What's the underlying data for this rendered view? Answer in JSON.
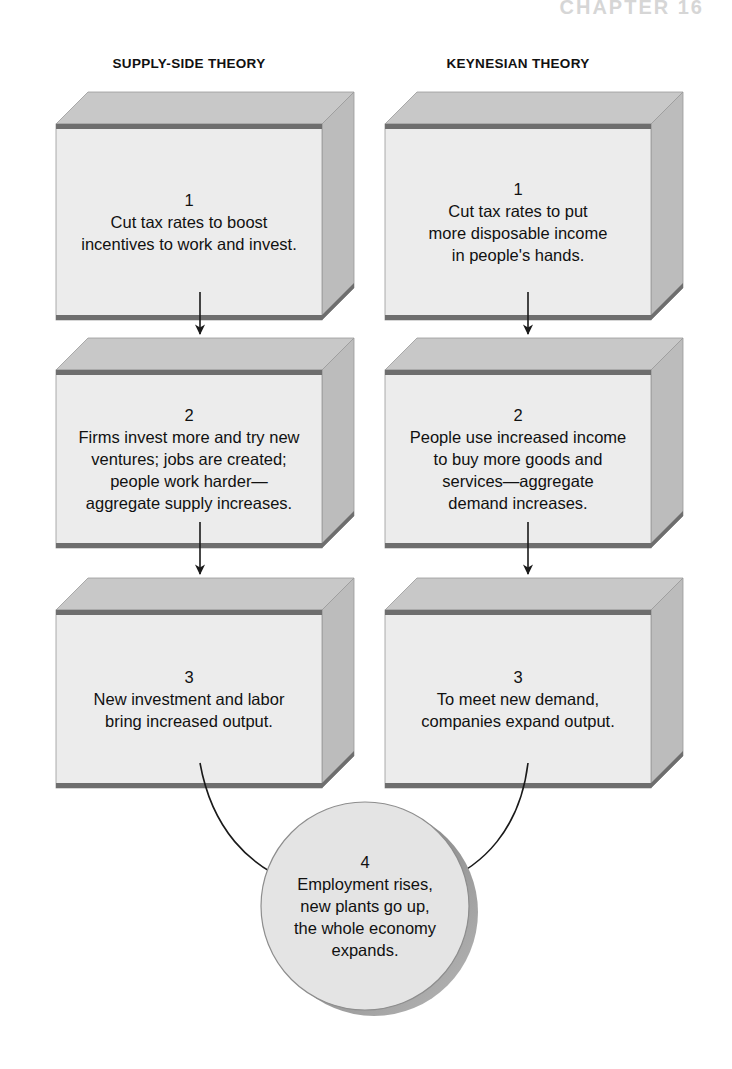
{
  "page": {
    "running_head": "CHAPTER 16",
    "background": "#ffffff",
    "width": 732,
    "height": 1069
  },
  "columns": [
    {
      "id": "supply-side",
      "title": "SUPPLY-SIDE THEORY"
    },
    {
      "id": "keynesian",
      "title": "KEYNESIAN THEORY"
    }
  ],
  "style": {
    "box_front": "#ececec",
    "box_top": "#c8c8c8",
    "box_side": "#bcbcbc",
    "bevel_line": "#6e6e6e",
    "outline": "#9a9a9a",
    "disk_face": "#e4e4e4",
    "disk_rim": "#a5a5a5",
    "arrow": "#1a1a1a"
  },
  "boxes": [
    {
      "col": 0,
      "row": 0,
      "number": "1",
      "text": "Cut tax rates to boost\nincentives to work and invest.",
      "x": 56,
      "y": 92,
      "w": 266,
      "h": 196,
      "depth": 16
    },
    {
      "col": 0,
      "row": 1,
      "number": "2",
      "text": "Firms invest more and try new\nventures; jobs are created;\npeople work harder—\naggregate supply increases.",
      "x": 56,
      "y": 338,
      "w": 266,
      "h": 178,
      "depth": 16
    },
    {
      "col": 0,
      "row": 2,
      "number": "3",
      "text": "New investment and labor\nbring increased output.",
      "x": 56,
      "y": 578,
      "w": 266,
      "h": 178,
      "depth": 16
    },
    {
      "col": 1,
      "row": 0,
      "number": "1",
      "text": "Cut tax rates to put\nmore disposable income\nin people's hands.",
      "x": 385,
      "y": 92,
      "w": 266,
      "h": 196,
      "depth": 16
    },
    {
      "col": 1,
      "row": 1,
      "number": "2",
      "text": "People use increased income\nto buy more goods and\nservices—aggregate\ndemand increases.",
      "x": 385,
      "y": 338,
      "w": 266,
      "h": 178,
      "depth": 16
    },
    {
      "col": 1,
      "row": 2,
      "number": "3",
      "text": "To meet new demand,\ncompanies expand output.",
      "x": 385,
      "y": 578,
      "w": 266,
      "h": 178,
      "depth": 16
    }
  ],
  "disk": {
    "number": "4",
    "text": "Employment rises,\nnew plants go up,\nthe whole economy\nexpands.",
    "cx": 365,
    "cy": 906,
    "r": 104
  },
  "connectors": [
    {
      "kind": "straight",
      "from": "box-0-0",
      "to": "box-0-1",
      "x": 200,
      "y1": 292,
      "y2": 334
    },
    {
      "kind": "straight",
      "from": "box-0-1",
      "to": "box-0-2",
      "x": 200,
      "y1": 522,
      "y2": 574
    },
    {
      "kind": "straight",
      "from": "box-1-0",
      "to": "box-1-1",
      "x": 528,
      "y1": 292,
      "y2": 334
    },
    {
      "kind": "straight",
      "from": "box-1-1",
      "to": "box-1-2",
      "x": 528,
      "y1": 522,
      "y2": 574
    },
    {
      "kind": "curve",
      "from": "box-0-2",
      "to": "disk",
      "d": "M 200 763 C 212 830 250 866 292 882"
    },
    {
      "kind": "curve",
      "from": "box-1-2",
      "to": "disk",
      "d": "M 528 763 C 520 830 482 866 442 882"
    }
  ]
}
